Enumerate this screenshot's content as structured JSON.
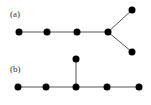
{
  "figure": {
    "panels": [
      {
        "label": "(a)",
        "label_pos": [
          10,
          17
        ],
        "nodes": [
          [
            19,
            32
          ],
          [
            47,
            32
          ],
          [
            77,
            32
          ],
          [
            108,
            32
          ],
          [
            132,
            10
          ],
          [
            132,
            52
          ]
        ],
        "edges": [
          [
            0,
            1
          ],
          [
            1,
            2
          ],
          [
            2,
            3
          ],
          [
            3,
            4
          ],
          [
            3,
            5
          ]
        ]
      },
      {
        "label": "(b)",
        "label_pos": [
          10,
          72
        ],
        "nodes": [
          [
            18,
            87
          ],
          [
            46,
            87
          ],
          [
            76,
            87
          ],
          [
            107,
            87
          ],
          [
            139,
            87
          ],
          [
            76,
            59
          ]
        ],
        "edges": [
          [
            0,
            1
          ],
          [
            1,
            2
          ],
          [
            2,
            3
          ],
          [
            3,
            4
          ],
          [
            2,
            5
          ]
        ]
      }
    ],
    "colors": {
      "node": "#000000",
      "edge": "#555555",
      "label": "#333333"
    },
    "node_radius": 3.5
  }
}
